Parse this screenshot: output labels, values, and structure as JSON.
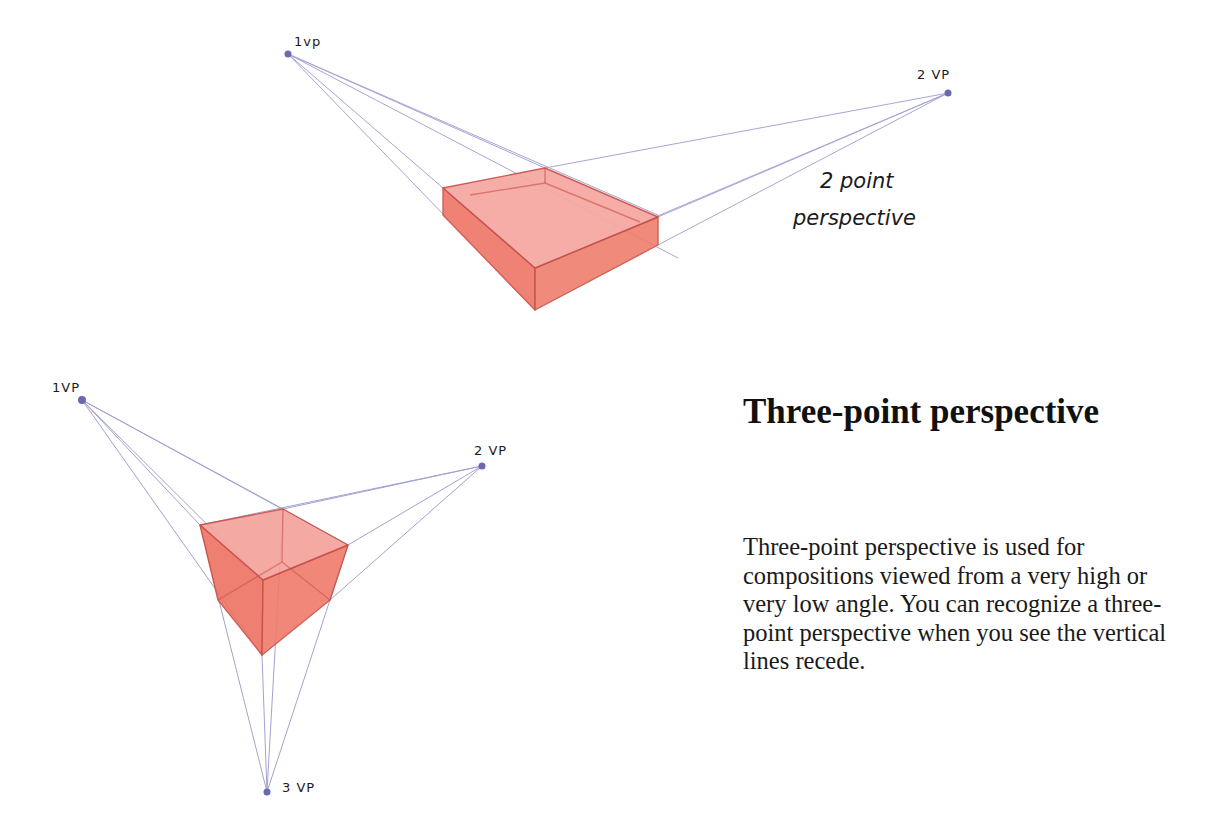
{
  "two_point": {
    "caption_line1": "2 point",
    "caption_line2": "perspective",
    "vp1_label": "1vp",
    "vp2_label": "2 VP",
    "vp1": [
      288,
      54
    ],
    "vp2": [
      948,
      93
    ]
  },
  "three_point": {
    "vp1_label": "1VP",
    "vp2_label": "2 VP",
    "vp3_label": "3 VP",
    "vp1": [
      82,
      400
    ],
    "vp2": [
      482,
      466
    ],
    "vp3": [
      267,
      792
    ]
  },
  "text": {
    "heading": "Three-point perspective",
    "paragraph": "Three-point perspective is used for compositions viewed from a very high or very low angle. You can recognize a three-point perspective when you see the vertical lines recede."
  },
  "colors": {
    "background": "#ffffff",
    "box_fill": "#f07a6a",
    "box_top": "#f5a3a0",
    "box_edge": "#c8504a",
    "guide_line": "#8a88c8",
    "vp_dot": "#6a68b0"
  }
}
